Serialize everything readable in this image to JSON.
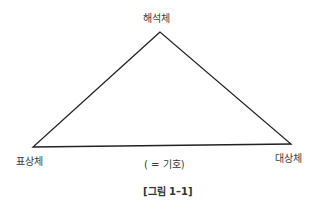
{
  "diagram": {
    "type": "semiotic-triangle",
    "nodes": {
      "top": {
        "label": "해석체"
      },
      "left": {
        "label": "표상체"
      },
      "right": {
        "label": "대상체"
      }
    },
    "base_label": "( = 기호)",
    "caption": "[그림 1–1]",
    "line_color": "#222222"
  }
}
